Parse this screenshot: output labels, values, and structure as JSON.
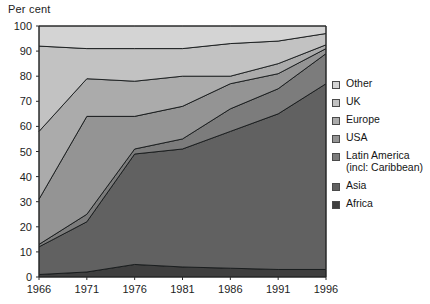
{
  "axis_title": "Per cent",
  "legend": {
    "items": [
      {
        "label": "Other",
        "label2": "",
        "color": "#d4d4d4"
      },
      {
        "label": "UK",
        "label2": "",
        "color": "#c2c2c2"
      },
      {
        "label": "Europe",
        "label2": "",
        "color": "#ababab"
      },
      {
        "label": "USA",
        "label2": "",
        "color": "#949494"
      },
      {
        "label": "Latin America",
        "label2": "(incl: Caribbean)",
        "color": "#7c7c7c"
      },
      {
        "label": "Asia",
        "label2": "",
        "color": "#616161"
      },
      {
        "label": "Africa",
        "label2": "",
        "color": "#3f3f3f"
      }
    ]
  },
  "chart_data": {
    "type": "area",
    "title": "",
    "xlabel": "",
    "ylabel": "Per cent",
    "ylim": [
      0,
      100
    ],
    "yticks": [
      0,
      10,
      20,
      30,
      40,
      50,
      60,
      70,
      80,
      90,
      100
    ],
    "categories": [
      "1966",
      "1971",
      "1976",
      "1981",
      "1986",
      "1991",
      "1996"
    ],
    "x": [
      1966,
      1971,
      1976,
      1981,
      1986,
      1991,
      1996
    ],
    "stacked": true,
    "stack_order_bottom_to_top": [
      "Africa",
      "Asia",
      "Latin America (incl: Caribbean)",
      "USA",
      "Europe",
      "UK",
      "Other"
    ],
    "grid": false,
    "legend_position": "right",
    "series": [
      {
        "name": "Africa",
        "color": "#3f3f3f",
        "values": [
          1,
          2,
          5,
          4,
          3.5,
          3,
          3
        ]
      },
      {
        "name": "Asia",
        "color": "#616161",
        "values": [
          11,
          20,
          44,
          47,
          54.5,
          62,
          74
        ]
      },
      {
        "name": "Latin America (incl: Caribbean)",
        "color": "#7c7c7c",
        "values": [
          1,
          3,
          2,
          4,
          9,
          10,
          12
        ]
      },
      {
        "name": "USA",
        "color": "#949494",
        "values": [
          18,
          39,
          13,
          13,
          10,
          6,
          2
        ]
      },
      {
        "name": "Europe",
        "color": "#ababab",
        "values": [
          27,
          15,
          14,
          12,
          3,
          4,
          1.5
        ]
      },
      {
        "name": "UK",
        "color": "#c2c2c2",
        "values": [
          34,
          12,
          13,
          11,
          13,
          9,
          4.5
        ]
      },
      {
        "name": "Other",
        "color": "#d4d4d4",
        "values": [
          8,
          9,
          9,
          9,
          7,
          6,
          3
        ]
      }
    ],
    "cumulative_tops": {
      "Africa": [
        1,
        2,
        5,
        4,
        3.5,
        3,
        3
      ],
      "Asia": [
        12,
        22,
        49,
        51,
        58,
        65,
        77
      ],
      "LatinAmerica": [
        13,
        25,
        51,
        55,
        67,
        75,
        89
      ],
      "USA": [
        31,
        64,
        64,
        68,
        77,
        81,
        91
      ],
      "Europe": [
        58,
        79,
        78,
        80,
        80,
        85,
        92.5
      ],
      "UK": [
        92,
        91,
        91,
        91,
        93,
        94,
        97
      ],
      "Other": [
        100,
        100,
        100,
        100,
        100,
        100,
        100
      ]
    }
  }
}
